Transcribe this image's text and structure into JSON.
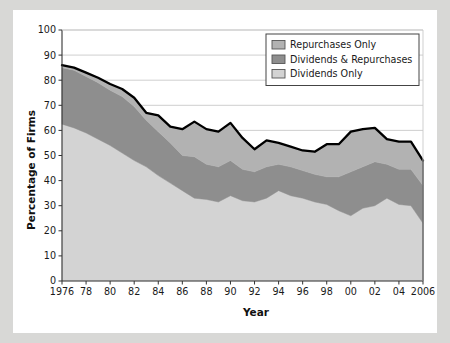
{
  "figure": {
    "background_color": "#d8d8d6",
    "card_color": "#ffffff"
  },
  "chart_data": {
    "type": "area",
    "stacked": true,
    "title": "",
    "subtitle": "",
    "xlabel": "Year",
    "ylabel": "Percentage of Firms",
    "xlim": [
      1976,
      2006
    ],
    "ylim": [
      0,
      100
    ],
    "yticks": [
      0,
      10,
      20,
      30,
      40,
      50,
      60,
      70,
      80,
      90,
      100
    ],
    "ytick_labels": [
      "0",
      "10",
      "20",
      "30",
      "40",
      "50",
      "60",
      "70",
      "80",
      "90",
      "100"
    ],
    "xticks": [
      1976,
      1978,
      1980,
      1982,
      1984,
      1986,
      1988,
      1990,
      1992,
      1994,
      1996,
      1998,
      2000,
      2002,
      2004,
      2006
    ],
    "xtick_labels": [
      "1976",
      "78",
      "80",
      "82",
      "84",
      "86",
      "88",
      "90",
      "92",
      "94",
      "96",
      "98",
      "00",
      "02",
      "04",
      "2006"
    ],
    "grid": "horizontal",
    "gridlines_at": [
      60,
      70,
      80,
      90,
      100
    ],
    "legend_position": "top-right",
    "x": [
      1976,
      1977,
      1978,
      1979,
      1980,
      1981,
      1982,
      1983,
      1984,
      1985,
      1986,
      1987,
      1988,
      1989,
      1990,
      1991,
      1992,
      1993,
      1994,
      1995,
      1996,
      1997,
      1998,
      1999,
      2000,
      2001,
      2002,
      2003,
      2004,
      2005,
      2006
    ],
    "series": [
      {
        "name": "Dividends Only",
        "color": "#d3d3d3",
        "stack_order": 1,
        "values": [
          62.5,
          61.0,
          59.0,
          56.5,
          54.0,
          51.0,
          48.0,
          45.5,
          42.0,
          39.0,
          36.0,
          33.0,
          32.5,
          31.5,
          34.0,
          32.0,
          31.5,
          33.0,
          36.0,
          34.0,
          33.0,
          31.5,
          30.5,
          28.0,
          26.0,
          29.0,
          30.0,
          33.0,
          30.5,
          30.0,
          23.0
        ]
      },
      {
        "name": "Dividends & Repurchases",
        "color": "#8e8e8e",
        "stack_order": 2,
        "values": [
          22.5,
          23.0,
          22.5,
          22.5,
          22.0,
          22.5,
          21.5,
          18.5,
          17.5,
          16.0,
          14.0,
          16.5,
          14.0,
          14.0,
          14.0,
          12.5,
          12.0,
          12.5,
          10.5,
          11.5,
          11.0,
          11.0,
          11.0,
          13.5,
          17.5,
          16.5,
          17.5,
          13.5,
          14.0,
          14.5,
          15.0
        ]
      },
      {
        "name": "Repurchases Only",
        "color": "#b2b2b2",
        "stack_order": 3,
        "values": [
          1.0,
          1.0,
          1.5,
          2.0,
          2.5,
          3.0,
          3.5,
          3.0,
          6.5,
          6.5,
          10.5,
          14.0,
          14.0,
          14.0,
          15.0,
          12.5,
          9.0,
          10.5,
          8.5,
          8.0,
          8.0,
          9.0,
          13.0,
          13.0,
          16.0,
          15.0,
          13.5,
          10.0,
          11.0,
          11.0,
          10.0
        ]
      }
    ],
    "total_line": {
      "name": "total-outline",
      "color": "#000000",
      "values": [
        86.0,
        85.0,
        83.0,
        81.0,
        78.5,
        76.5,
        73.0,
        67.0,
        66.0,
        61.5,
        60.5,
        63.5,
        60.5,
        59.5,
        63.0,
        57.0,
        52.5,
        56.0,
        55.0,
        53.5,
        52.0,
        51.5,
        54.5,
        54.5,
        59.5,
        60.5,
        61.0,
        56.5,
        55.5,
        55.5,
        48.0
      ]
    }
  },
  "legend": {
    "items": [
      {
        "label": "Repurchases Only",
        "color": "#b2b2b2"
      },
      {
        "label": "Dividends & Repurchases",
        "color": "#8e8e8e"
      },
      {
        "label": "Dividends Only",
        "color": "#d3d3d3"
      }
    ]
  }
}
